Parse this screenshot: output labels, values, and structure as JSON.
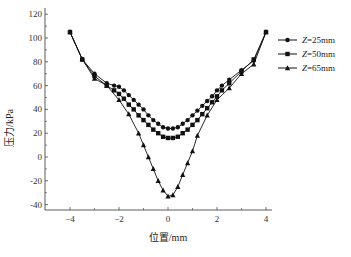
{
  "chart_data": {
    "type": "line",
    "title": "",
    "xlabel": "位置/mm",
    "ylabel": "压力/kPa",
    "xlim": [
      -5,
      4.3
    ],
    "ylim": [
      -50,
      120
    ],
    "xticks": [
      -4,
      -2,
      0,
      2,
      4
    ],
    "yticks": [
      -40,
      -20,
      0,
      20,
      40,
      60,
      80,
      100,
      120
    ],
    "grid": false,
    "legend_position": "right-top-outside",
    "series": [
      {
        "name": "Z=25mm",
        "marker": "circle",
        "x": [
          -4.0,
          -3.5,
          -3.0,
          -2.5,
          -2.2,
          -2.0,
          -1.8,
          -1.6,
          -1.4,
          -1.2,
          -1.0,
          -0.8,
          -0.6,
          -0.4,
          -0.2,
          0.0,
          0.2,
          0.4,
          0.6,
          0.8,
          1.0,
          1.2,
          1.4,
          1.6,
          1.8,
          2.0,
          2.2,
          2.5,
          3.0,
          3.5,
          4.0
        ],
        "y": [
          105,
          82,
          70,
          62,
          60,
          59,
          56,
          52,
          48,
          44,
          40,
          35,
          31,
          28,
          25,
          24,
          24,
          25,
          28,
          31,
          35,
          39,
          43,
          47,
          51,
          56,
          60,
          65,
          73,
          81,
          105
        ]
      },
      {
        "name": "Z=50mm",
        "marker": "square",
        "x": [
          -4.0,
          -3.5,
          -3.0,
          -2.5,
          -2.2,
          -2.0,
          -1.8,
          -1.6,
          -1.4,
          -1.2,
          -1.0,
          -0.8,
          -0.6,
          -0.4,
          -0.2,
          0.0,
          0.2,
          0.4,
          0.6,
          0.8,
          1.0,
          1.2,
          1.4,
          1.6,
          1.8,
          2.0,
          2.2,
          2.5,
          3.0,
          3.5,
          4.0
        ],
        "y": [
          105,
          82,
          68,
          60,
          56,
          53,
          49,
          44,
          40,
          35,
          31,
          27,
          23,
          20,
          17,
          16,
          16,
          17,
          20,
          23,
          27,
          31,
          36,
          41,
          46,
          51,
          56,
          62,
          72,
          82,
          105
        ]
      },
      {
        "name": "Z=65mm",
        "marker": "triangle",
        "x": [
          -4.0,
          -3.5,
          -3.0,
          -2.5,
          -2.0,
          -1.6,
          -1.2,
          -1.0,
          -0.8,
          -0.6,
          -0.4,
          -0.2,
          0.0,
          0.2,
          0.4,
          0.6,
          0.8,
          1.0,
          1.2,
          1.6,
          2.0,
          2.5,
          3.0,
          3.5,
          4.0
        ],
        "y": [
          105,
          82,
          66,
          60,
          48,
          36,
          20,
          10,
          0,
          -10,
          -20,
          -28,
          -33,
          -32,
          -25,
          -15,
          -5,
          5,
          18,
          35,
          48,
          58,
          70,
          78,
          105
        ]
      }
    ]
  }
}
